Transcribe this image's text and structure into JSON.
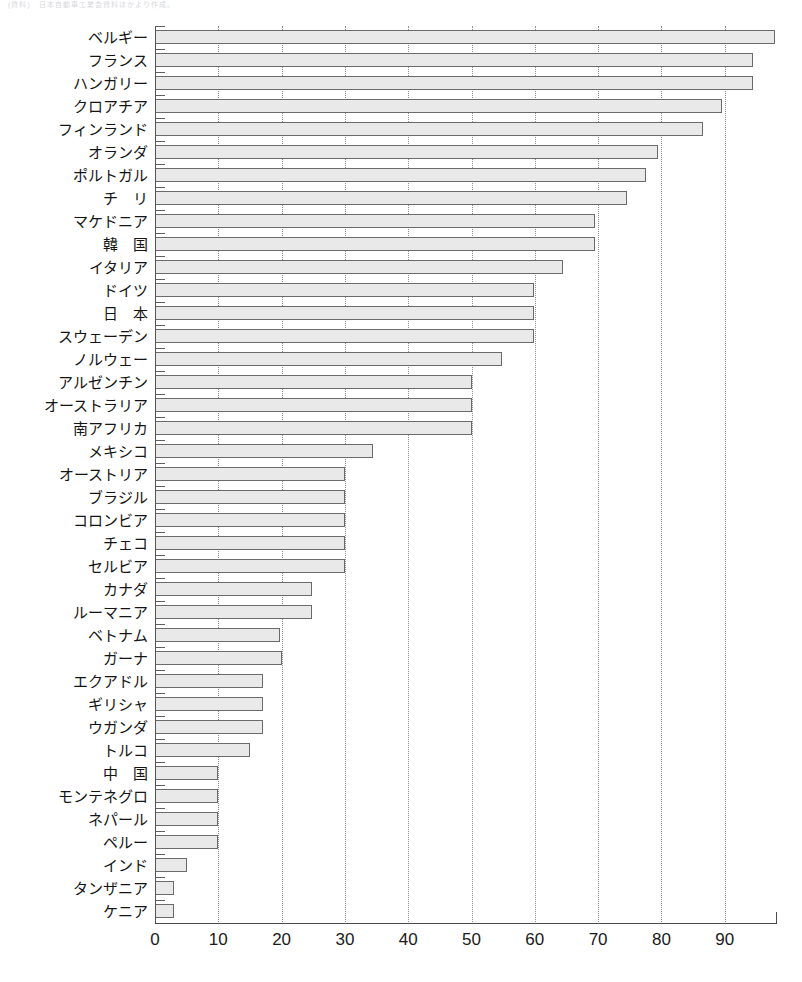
{
  "header_fragment": "(資料)　日本自動車工業会資料ほかより作成。",
  "chart_data": {
    "type": "bar",
    "orientation": "horizontal",
    "title": "",
    "xlabel": "",
    "ylabel": "",
    "xlim": [
      0,
      98
    ],
    "xticks": [
      0,
      10,
      20,
      30,
      40,
      50,
      60,
      70,
      80,
      90
    ],
    "xtick_labels": [
      "0",
      "10",
      "20",
      "30",
      "40",
      "50",
      "60",
      "70",
      "80",
      "90"
    ],
    "grid": "vertical-dotted",
    "legend": "none",
    "bar_fill_color": "#e9e9e9",
    "bar_border_color": "#6a6a6a",
    "categories": [
      "ベルギー",
      "フランス",
      "ハンガリー",
      "クロアチア",
      "フィンランド",
      "オランダ",
      "ポルトガル",
      "チ　リ",
      "マケドニア",
      "韓　国",
      "イタリア",
      "ドイツ",
      "日　本",
      "スウェーデン",
      "ノルウェー",
      "アルゼンチン",
      "オーストラリア",
      "南アフリカ",
      "メキシコ",
      "オーストリア",
      "ブラジル",
      "コロンビア",
      "チェコ",
      "セルビア",
      "カナダ",
      "ルーマニア",
      "ベトナム",
      "ガーナ",
      "エクアドル",
      "ギリシャ",
      "ウガンダ",
      "トルコ",
      "中　国",
      "モンテネグロ",
      "ネパール",
      "ペルー",
      "インド",
      "タンザニア",
      "ケニア"
    ],
    "values": [
      98.0,
      94.5,
      94.5,
      89.5,
      86.5,
      79.5,
      77.5,
      74.5,
      69.5,
      69.5,
      64.5,
      59.8,
      59.8,
      59.8,
      54.8,
      50.0,
      50.0,
      50.0,
      34.5,
      30.0,
      30.0,
      30.0,
      30.0,
      30.0,
      24.8,
      24.8,
      19.8,
      20.0,
      17.0,
      17.0,
      17.0,
      15.0,
      10.0,
      10.0,
      10.0,
      10.0,
      5.0,
      3.0,
      3.0
    ]
  }
}
